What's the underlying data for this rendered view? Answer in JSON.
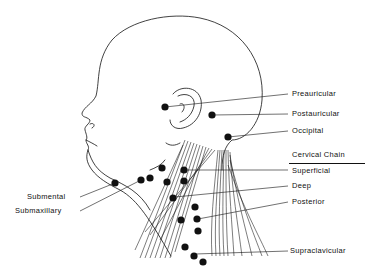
{
  "diagram": {
    "colors": {
      "ink": "#111111",
      "background": "#ffffff"
    },
    "labels": {
      "preauricular": "Preauricular",
      "postauricular": "Postauricular",
      "occipital": "Occipital",
      "cervical_chain_heading": "Cervical Chain",
      "superficial": "Superficial",
      "deep": "Deep",
      "posterior": "Posterior",
      "supraclavicular": "Supraclavicular",
      "submental": "Submental",
      "submaxillary": "Submaxillary"
    },
    "node_groups": [
      {
        "name": "Preauricular",
        "count": 1
      },
      {
        "name": "Postauricular",
        "count": 1
      },
      {
        "name": "Occipital",
        "count": 1
      },
      {
        "name": "Submental",
        "count": 1
      },
      {
        "name": "Submaxillary",
        "count": 2
      },
      {
        "name": "Superficial cervical",
        "count": 3
      },
      {
        "name": "Deep cervical",
        "count": 4
      },
      {
        "name": "Posterior cervical",
        "count": 3
      },
      {
        "name": "Supraclavicular",
        "count": 3
      }
    ]
  }
}
